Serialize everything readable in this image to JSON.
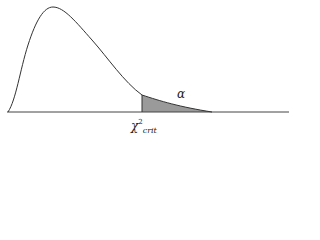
{
  "diagram": {
    "title": "",
    "distribution": "chi-square",
    "labels": {
      "tail_area": "α",
      "critical_value_base": "χ",
      "critical_value_sup": "2",
      "critical_value_sub": "crit"
    },
    "colors": {
      "curve": "#333333",
      "axis": "#444444",
      "shade": "#9a9a9a",
      "background": "#ffffff"
    }
  }
}
